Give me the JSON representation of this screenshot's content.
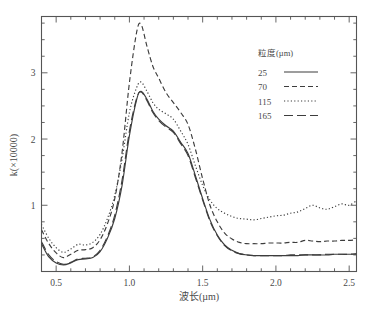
{
  "chart_data": {
    "type": "line",
    "title": "",
    "xlabel": "波长(µm)",
    "ylabel": "k(×10000)",
    "xlim": [
      0.4,
      2.55
    ],
    "ylim": [
      0.0,
      3.85
    ],
    "xticks": [
      0.5,
      1.0,
      1.5,
      2.0,
      2.5
    ],
    "xtick_labels": [
      "0.5",
      "1.0",
      "1.5",
      "2.0",
      "2.5"
    ],
    "yticks": [
      1,
      2,
      3
    ],
    "ytick_labels": [
      "1",
      "2",
      "3"
    ],
    "grid": false,
    "legend_position": "top-right",
    "legend_title": "粒度(µm)",
    "x": [
      0.4,
      0.45,
      0.5,
      0.55,
      0.6,
      0.65,
      0.7,
      0.75,
      0.8,
      0.85,
      0.9,
      0.95,
      1.0,
      1.05,
      1.08,
      1.12,
      1.16,
      1.2,
      1.25,
      1.3,
      1.35,
      1.4,
      1.45,
      1.5,
      1.55,
      1.6,
      1.65,
      1.7,
      1.75,
      1.8,
      1.85,
      1.9,
      1.95,
      2.0,
      2.05,
      2.1,
      2.15,
      2.2,
      2.25,
      2.3,
      2.35,
      2.4,
      2.45,
      2.5,
      2.55
    ],
    "series": [
      {
        "name": "25",
        "label": "25",
        "linestyle": "solid",
        "dash": "none",
        "color": "#3d3d3d",
        "values": [
          0.42,
          0.22,
          0.13,
          0.1,
          0.13,
          0.18,
          0.19,
          0.21,
          0.3,
          0.5,
          0.8,
          1.3,
          2.05,
          2.6,
          2.72,
          2.6,
          2.42,
          2.3,
          2.2,
          2.12,
          1.95,
          1.78,
          1.45,
          1.1,
          0.78,
          0.55,
          0.4,
          0.32,
          0.27,
          0.25,
          0.24,
          0.24,
          0.24,
          0.24,
          0.24,
          0.24,
          0.24,
          0.25,
          0.25,
          0.25,
          0.25,
          0.26,
          0.26,
          0.26,
          0.26
        ]
      },
      {
        "name": "70",
        "label": "70",
        "linestyle": "dashed-short",
        "dash": "5,3",
        "color": "#3d3d3d",
        "values": [
          0.63,
          0.42,
          0.28,
          0.21,
          0.26,
          0.32,
          0.33,
          0.36,
          0.48,
          0.72,
          1.1,
          1.8,
          2.85,
          3.62,
          3.73,
          3.4,
          3.1,
          2.92,
          2.7,
          2.55,
          2.4,
          2.22,
          1.85,
          1.4,
          1.0,
          0.75,
          0.58,
          0.49,
          0.44,
          0.42,
          0.42,
          0.42,
          0.43,
          0.43,
          0.43,
          0.44,
          0.44,
          0.47,
          0.46,
          0.45,
          0.46,
          0.46,
          0.47,
          0.47,
          0.48
        ]
      },
      {
        "name": "115",
        "label": "115",
        "linestyle": "dotted",
        "dash": "1.2,2.2",
        "color": "#3d3d3d",
        "values": [
          0.71,
          0.5,
          0.36,
          0.29,
          0.34,
          0.41,
          0.4,
          0.44,
          0.56,
          0.8,
          1.15,
          1.7,
          2.4,
          2.78,
          2.86,
          2.72,
          2.55,
          2.45,
          2.38,
          2.3,
          2.12,
          1.92,
          1.6,
          1.3,
          1.08,
          0.95,
          0.88,
          0.83,
          0.8,
          0.79,
          0.78,
          0.8,
          0.82,
          0.84,
          0.85,
          0.88,
          0.9,
          0.95,
          1.0,
          0.96,
          0.94,
          0.98,
          1.02,
          1.0,
          1.07
        ]
      },
      {
        "name": "165",
        "label": "165",
        "linestyle": "dashed-long",
        "dash": "9,4",
        "color": "#3d3d3d",
        "values": [
          0.45,
          0.25,
          0.15,
          0.11,
          0.14,
          0.19,
          0.2,
          0.22,
          0.32,
          0.53,
          0.85,
          1.38,
          2.12,
          2.62,
          2.71,
          2.58,
          2.4,
          2.28,
          2.18,
          2.1,
          1.93,
          1.75,
          1.42,
          1.08,
          0.76,
          0.54,
          0.39,
          0.31,
          0.27,
          0.25,
          0.24,
          0.24,
          0.24,
          0.24,
          0.24,
          0.25,
          0.25,
          0.25,
          0.25,
          0.25,
          0.26,
          0.26,
          0.26,
          0.26,
          0.27
        ]
      }
    ]
  },
  "axes": {
    "x_label": "波长(µm)",
    "y_label": "k(×10000)",
    "x_ticks": [
      "0.5",
      "1.0",
      "1.5",
      "2.0",
      "2.5"
    ],
    "y_ticks": [
      "3",
      "2",
      "1"
    ]
  },
  "legend": {
    "title": "粒度(µm)",
    "items": [
      {
        "label": "25"
      },
      {
        "label": "70"
      },
      {
        "label": "115"
      },
      {
        "label": "165"
      }
    ]
  }
}
